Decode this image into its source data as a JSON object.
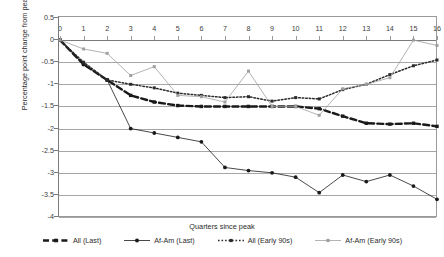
{
  "chart_data": {
    "type": "line",
    "title": "",
    "xlabel": "Quarters since peak",
    "ylabel": "Percentage point change from peak",
    "xlim": [
      0,
      16
    ],
    "ylim": [
      -4,
      0.5
    ],
    "yticks": [
      0.5,
      0,
      -0.5,
      -1,
      -1.5,
      -2,
      -2.5,
      -3,
      -3.5,
      -4
    ],
    "ytick_labels": [
      "0.5",
      "0",
      "-0.5",
      "-1",
      "-1.5",
      "-2",
      "-2.5",
      "-3",
      "-3.5",
      "-4"
    ],
    "xticks": [
      0,
      1,
      2,
      3,
      4,
      5,
      6,
      7,
      8,
      9,
      10,
      11,
      12,
      13,
      14,
      15,
      16
    ],
    "xtick_labels": [
      "0",
      "1",
      "2",
      "3",
      "4",
      "5",
      "6",
      "7",
      "8",
      "9",
      "10",
      "11",
      "12",
      "13",
      "14",
      "15",
      "16"
    ],
    "grid": true,
    "legend_position": "bottom",
    "x": [
      0,
      1,
      2,
      3,
      4,
      5,
      6,
      7,
      8,
      9,
      10,
      11,
      12,
      13,
      14,
      15,
      16
    ],
    "series": [
      {
        "name": "All (Last)",
        "style": "dashed-thick",
        "color": "#1a1a1a",
        "marker": "square",
        "values": [
          0,
          -0.55,
          -0.9,
          -1.25,
          -1.4,
          -1.48,
          -1.5,
          -1.5,
          -1.5,
          -1.5,
          -1.5,
          -1.55,
          -1.72,
          -1.88,
          -1.9,
          -1.88,
          -1.95
        ]
      },
      {
        "name": "Af-Am (Last)",
        "style": "solid-thin",
        "color": "#1a1a1a",
        "marker": "circle",
        "values": [
          0,
          -0.55,
          -0.9,
          -2.0,
          -2.1,
          -2.2,
          -2.3,
          -2.88,
          -2.95,
          -3.0,
          -3.1,
          -3.45,
          -3.05,
          -3.2,
          -3.05,
          -3.3,
          -3.6
        ]
      },
      {
        "name": "All (Early 90s)",
        "style": "dotted",
        "color": "#2b2b2b",
        "marker": "square",
        "values": [
          0,
          -0.5,
          -0.9,
          -1.0,
          -1.08,
          -1.2,
          -1.25,
          -1.3,
          -1.28,
          -1.38,
          -1.3,
          -1.33,
          -1.12,
          -1.0,
          -0.78,
          -0.58,
          -0.45
        ]
      },
      {
        "name": "Af-Am (Early 90s)",
        "style": "solid-thin-gray",
        "color": "#a0a0a0",
        "marker": "square",
        "values": [
          0,
          -0.2,
          -0.3,
          -0.8,
          -0.6,
          -1.25,
          -1.28,
          -1.4,
          -0.7,
          -1.5,
          -1.5,
          -1.7,
          -1.1,
          -1.0,
          -0.85,
          0.0,
          -0.12
        ]
      }
    ]
  },
  "axis": {
    "y_title": "Percentage point change from peak",
    "x_title": "Quarters since peak"
  },
  "legend": {
    "items": [
      {
        "label": "All (Last)",
        "key": "all-last"
      },
      {
        "label": "Af-Am (Last)",
        "key": "af-am-last"
      },
      {
        "label": "All (Early 90s)",
        "key": "all-early-90s"
      },
      {
        "label": "Af-Am (Early 90s)",
        "key": "af-am-early-90s"
      }
    ]
  }
}
